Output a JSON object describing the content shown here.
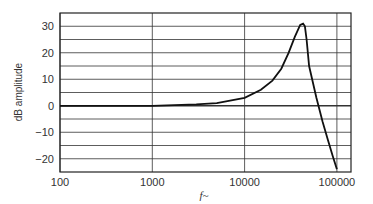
{
  "chart_data": {
    "type": "line",
    "title": "",
    "xlabel": "f~",
    "ylabel": "dB amplitude",
    "x_scale": "log",
    "xlim": [
      100,
      150000
    ],
    "ylim": [
      -25,
      35
    ],
    "x_ticks": [
      100,
      1000,
      10000,
      100000
    ],
    "x_tick_labels": [
      "100",
      "1000",
      "10000",
      "100000"
    ],
    "y_ticks": [
      30,
      20,
      10,
      0,
      -10,
      -20
    ],
    "y_tick_labels": [
      "30",
      "20",
      "10",
      "0",
      "-10",
      "-20"
    ],
    "grid": true,
    "grid_y_step": 5,
    "series": [
      {
        "name": "response",
        "x": [
          100,
          1000,
          3000,
          5000,
          10000,
          15000,
          20000,
          25000,
          30000,
          35000,
          40000,
          43000,
          45000,
          47000,
          50000,
          60000,
          70000,
          80000,
          90000,
          100000
        ],
        "y": [
          0,
          0,
          0.5,
          1,
          3,
          6,
          9.5,
          14,
          20,
          26,
          30.5,
          31,
          30,
          25,
          15,
          3,
          -6,
          -13,
          -19,
          -24
        ]
      }
    ]
  }
}
